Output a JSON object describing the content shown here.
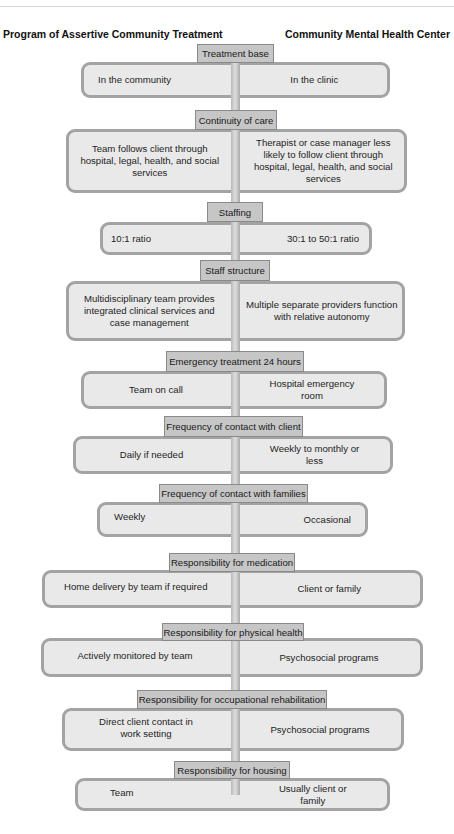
{
  "header": {
    "left_title": "Program of Assertive Community Treatment",
    "right_title": "Community Mental Health Center"
  },
  "rows": [
    {
      "category": "Treatment base",
      "pact": "In the community",
      "cmhc": "In the clinic"
    },
    {
      "category": "Continuity of care",
      "pact": "Team follows client through hospital, legal, health, and social services",
      "cmhc": "Therapist or case manager less likely to follow client through hospital, legal, health, and social services"
    },
    {
      "category": "Staffing",
      "pact": "10:1 ratio",
      "cmhc": "30:1 to 50:1 ratio"
    },
    {
      "category": "Staff structure",
      "pact": "Multidisciplinary team provides integrated clinical services and case management",
      "cmhc": "Multiple separate providers function with relative autonomy"
    },
    {
      "category": "Emergency treatment 24 hours",
      "pact": "Team on call",
      "cmhc": "Hospital emergency room"
    },
    {
      "category": "Frequency of contact with client",
      "pact": "Daily if needed",
      "cmhc": "Weekly to monthly or less"
    },
    {
      "category": "Frequency of contact with families",
      "pact": "Weekly",
      "cmhc": "Occasional"
    },
    {
      "category": "Responsibility for medication",
      "pact": "Home delivery by team if required",
      "cmhc": "Client or family"
    },
    {
      "category": "Responsibility for physical health",
      "pact": "Actively monitored by team",
      "cmhc": "Psychosocial programs"
    },
    {
      "category": "Responsibility for occupational rehabilitation",
      "pact": "Direct client contact in work setting",
      "cmhc": "Psychosocial programs"
    },
    {
      "category": "Responsibility for housing",
      "pact": "Team",
      "cmhc": "Usually client or family"
    }
  ]
}
